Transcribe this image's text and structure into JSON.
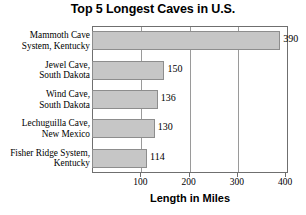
{
  "chart_data": {
    "type": "bar",
    "orientation": "horizontal",
    "title": "Top 5 Longest Caves in U.S.",
    "xlabel": "Length in Miles",
    "ylabel": "",
    "categories": [
      "Mammoth Cave System, Kentucky",
      "Jewel Cave, South Dakota",
      "Wind Cave, South Dakota",
      "Lechuguilla Cave, New Mexico",
      "Fisher Ridge System, Kentucky"
    ],
    "category_lines": [
      [
        "Mammoth Cave",
        "System, Kentucky"
      ],
      [
        "Jewel Cave,",
        "South Dakota"
      ],
      [
        "Wind Cave,",
        "South Dakota"
      ],
      [
        "Lechuguilla Cave,",
        "New Mexico"
      ],
      [
        "Fisher Ridge System,",
        "Kentucky"
      ]
    ],
    "values": [
      390,
      150,
      136,
      130,
      114
    ],
    "value_labels": [
      "390",
      "150",
      "136",
      "130",
      "114"
    ],
    "xlim": [
      0,
      406
    ],
    "xticks": [
      100,
      200,
      300,
      400
    ],
    "xtick_labels": [
      "100",
      "200",
      "300",
      "400"
    ],
    "grid": "vertical",
    "legend": "none",
    "bar_color": "#c6c6c6",
    "bar_border_color": "#8d8d8d",
    "gridline_color": "#9a9a9a",
    "axis_color": "#6f6f6f",
    "text_color": "#000000",
    "background_color": "#ffffff"
  }
}
